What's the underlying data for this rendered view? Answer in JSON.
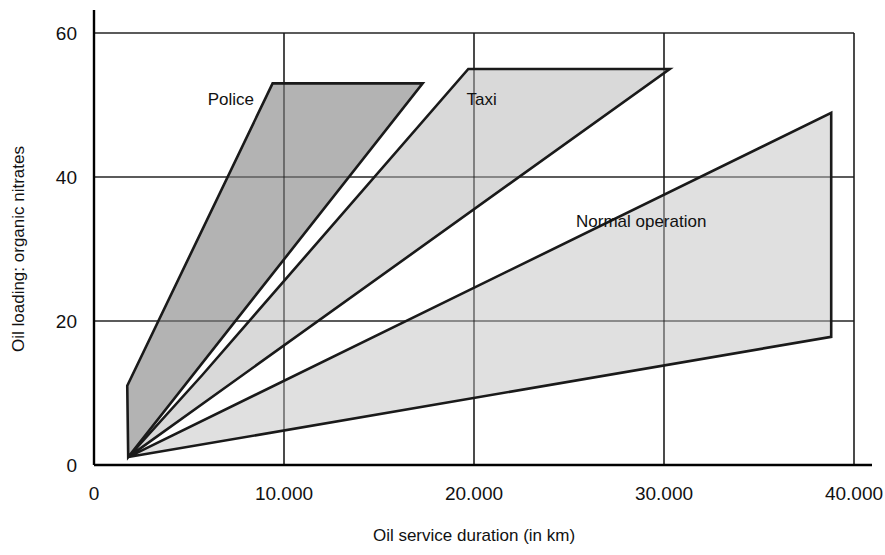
{
  "chart_data": {
    "type": "area",
    "title": "",
    "xlabel": "Oil service duration (in km)",
    "ylabel": "Oil loading: organic nitrates",
    "xlim": [
      0,
      40000
    ],
    "ylim": [
      0,
      62
    ],
    "xticks": [
      0,
      10000,
      20000,
      30000,
      40000
    ],
    "xtick_labels": [
      "0",
      "10.000",
      "20.000",
      "30.000",
      "40.000"
    ],
    "yticks": [
      0,
      20,
      40,
      60
    ],
    "ytick_labels": [
      "0",
      "20",
      "40",
      "60"
    ],
    "grid": true,
    "grid_axis": "both",
    "legend_position": "inline-annotations",
    "series": [
      {
        "name": "Police",
        "label": "Police",
        "fill": "#b3b3b3",
        "stroke": "#1a1a1a",
        "label_x": 7200,
        "label_y": 50,
        "polygon": [
          [
            1800,
            1.1
          ],
          [
            1750,
            11.0
          ],
          [
            9400,
            53.0
          ],
          [
            17300,
            53.0
          ]
        ]
      },
      {
        "name": "Taxi",
        "label": "Taxi",
        "fill": "#d9d9d9",
        "stroke": "#1a1a1a",
        "label_x": 20400,
        "label_y": 50,
        "polygon": [
          [
            1800,
            1.1
          ],
          [
            5700,
            12.5
          ],
          [
            19700,
            55.0
          ],
          [
            30300,
            55.0
          ]
        ]
      },
      {
        "name": "Normal operation",
        "label": "Normal operation",
        "fill": "#e0e0e0",
        "stroke": "#1a1a1a",
        "label_x": 28800,
        "label_y": 33,
        "polygon": [
          [
            1800,
            1.1
          ],
          [
            38800,
            48.9
          ],
          [
            38800,
            17.8
          ]
        ]
      }
    ]
  }
}
